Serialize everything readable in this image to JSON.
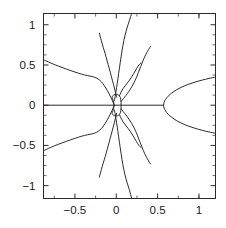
{
  "chart_data": {
    "type": "line",
    "title": "",
    "subtitle": "",
    "xlabel": "",
    "ylabel": "",
    "xlim": [
      -0.88,
      1.2
    ],
    "ylim": [
      -1.16,
      1.14
    ],
    "grid": false,
    "legend": null,
    "frame": true,
    "xticks": [
      -0.5,
      0,
      0.5,
      1
    ],
    "xtick_labels": [
      "-0.5",
      "0",
      "0.5",
      "1"
    ],
    "yticks": [
      -1,
      -0.5,
      0,
      0.5,
      1
    ],
    "ytick_labels": [
      "-1",
      "-0.5",
      "0",
      "0.5",
      "1"
    ],
    "x_minor_ticks": [
      -0.75,
      -0.25,
      0.25,
      0.75,
      1.0
    ],
    "y_minor_ticks": [
      -0.875,
      -0.75,
      -0.625,
      -0.375,
      -0.25,
      -0.125,
      0.125,
      0.25,
      0.375,
      0.625,
      0.75,
      0.875
    ],
    "series": [
      {
        "name": "real-axis-segment",
        "comment": "Horizontal line along y = 0 from left frame edge to the parabola vertex",
        "points": [
          [
            -0.88,
            0.0
          ],
          [
            0.57,
            0.0
          ]
        ]
      },
      {
        "name": "parabola-upper",
        "comment": "Upper half of rightward-opening branch from vertex near x = 0.57",
        "points": [
          [
            0.572,
            0.0
          ],
          [
            0.578,
            0.035
          ],
          [
            0.596,
            0.072
          ],
          [
            0.627,
            0.112
          ],
          [
            0.672,
            0.152
          ],
          [
            0.727,
            0.19
          ],
          [
            0.793,
            0.226
          ],
          [
            0.868,
            0.258
          ],
          [
            0.952,
            0.287
          ],
          [
            1.042,
            0.313
          ],
          [
            1.12,
            0.332
          ],
          [
            1.2,
            0.35
          ]
        ]
      },
      {
        "name": "parabola-lower",
        "comment": "Lower half of rightward-opening branch, mirror of parabola-upper",
        "points": [
          [
            0.572,
            0.0
          ],
          [
            0.578,
            -0.035
          ],
          [
            0.596,
            -0.072
          ],
          [
            0.627,
            -0.112
          ],
          [
            0.672,
            -0.152
          ],
          [
            0.727,
            -0.19
          ],
          [
            0.793,
            -0.226
          ],
          [
            0.868,
            -0.258
          ],
          [
            0.952,
            -0.287
          ],
          [
            1.042,
            -0.313
          ],
          [
            1.12,
            -0.332
          ],
          [
            1.2,
            -0.35
          ]
        ]
      },
      {
        "name": "left-branch-upper",
        "comment": "Long shallow branch exiting the left frame edge at about y = 0.57",
        "points": [
          [
            -0.88,
            0.566
          ],
          [
            -0.8,
            0.528
          ],
          [
            -0.7,
            0.486
          ],
          [
            -0.6,
            0.448
          ],
          [
            -0.5,
            0.412
          ],
          [
            -0.42,
            0.386
          ],
          [
            -0.35,
            0.368
          ],
          [
            -0.29,
            0.356
          ],
          [
            -0.24,
            0.338
          ],
          [
            -0.2,
            0.31
          ],
          [
            -0.165,
            0.272
          ],
          [
            -0.135,
            0.228
          ],
          [
            -0.108,
            0.182
          ],
          [
            -0.085,
            0.138
          ],
          [
            -0.066,
            0.098
          ],
          [
            -0.05,
            0.064
          ],
          [
            -0.038,
            0.036
          ],
          [
            -0.03,
            0.014
          ],
          [
            -0.026,
            0.0
          ]
        ]
      },
      {
        "name": "left-branch-lower",
        "comment": "Mirror of left-branch-upper below the axis",
        "points": [
          [
            -0.88,
            -0.566
          ],
          [
            -0.8,
            -0.528
          ],
          [
            -0.7,
            -0.486
          ],
          [
            -0.6,
            -0.448
          ],
          [
            -0.5,
            -0.412
          ],
          [
            -0.42,
            -0.386
          ],
          [
            -0.35,
            -0.368
          ],
          [
            -0.29,
            -0.356
          ],
          [
            -0.24,
            -0.338
          ],
          [
            -0.2,
            -0.31
          ],
          [
            -0.165,
            -0.272
          ],
          [
            -0.135,
            -0.228
          ],
          [
            -0.108,
            -0.182
          ],
          [
            -0.085,
            -0.138
          ],
          [
            -0.066,
            -0.098
          ],
          [
            -0.05,
            -0.064
          ],
          [
            -0.038,
            -0.036
          ],
          [
            -0.03,
            -0.014
          ],
          [
            -0.026,
            0.0
          ]
        ]
      },
      {
        "name": "loop-upper",
        "comment": "Upper arc of the small closed loop surrounding the origin",
        "points": [
          [
            -0.026,
            0.0
          ],
          [
            -0.03,
            0.028
          ],
          [
            -0.036,
            0.056
          ],
          [
            -0.044,
            0.082
          ],
          [
            -0.05,
            0.1
          ],
          [
            -0.044,
            0.116
          ],
          [
            -0.028,
            0.128
          ],
          [
            -0.006,
            0.134
          ],
          [
            0.018,
            0.13
          ],
          [
            0.038,
            0.116
          ],
          [
            0.05,
            0.094
          ],
          [
            0.056,
            0.066
          ],
          [
            0.058,
            0.034
          ],
          [
            0.058,
            0.0
          ]
        ]
      },
      {
        "name": "loop-lower",
        "comment": "Lower arc of the small closed loop surrounding the origin",
        "points": [
          [
            -0.026,
            0.0
          ],
          [
            -0.03,
            -0.028
          ],
          [
            -0.036,
            -0.056
          ],
          [
            -0.044,
            -0.082
          ],
          [
            -0.05,
            -0.1
          ],
          [
            -0.044,
            -0.116
          ],
          [
            -0.028,
            -0.128
          ],
          [
            -0.006,
            -0.134
          ],
          [
            0.018,
            -0.13
          ],
          [
            0.038,
            -0.116
          ],
          [
            0.05,
            -0.094
          ],
          [
            0.056,
            -0.066
          ],
          [
            0.058,
            -0.034
          ],
          [
            0.058,
            0.0
          ]
        ]
      },
      {
        "name": "steep-left-upper",
        "comment": "Steep branch rising from the knot to the top frame edge near x = 0.19",
        "points": [
          [
            -0.022,
            0.06
          ],
          [
            -0.01,
            0.13
          ],
          [
            0.004,
            0.22
          ],
          [
            0.02,
            0.33
          ],
          [
            0.038,
            0.46
          ],
          [
            0.058,
            0.6
          ],
          [
            0.08,
            0.74
          ],
          [
            0.104,
            0.86
          ],
          [
            0.13,
            0.96
          ],
          [
            0.158,
            1.05
          ],
          [
            0.186,
            1.14
          ]
        ]
      },
      {
        "name": "steep-left-lower",
        "comment": "Mirror of steep-left-upper descending to the bottom frame edge",
        "points": [
          [
            -0.022,
            -0.06
          ],
          [
            -0.01,
            -0.13
          ],
          [
            0.004,
            -0.22
          ],
          [
            0.02,
            -0.33
          ],
          [
            0.038,
            -0.46
          ],
          [
            0.058,
            -0.6
          ],
          [
            0.08,
            -0.74
          ],
          [
            0.104,
            -0.86
          ],
          [
            0.13,
            -0.96
          ],
          [
            0.158,
            -1.05
          ],
          [
            0.186,
            -1.16
          ]
        ]
      },
      {
        "name": "mid-upper-terminating",
        "comment": "Branch from knot rising left-of-centre, terminating at about (-0.20, 0.88)",
        "points": [
          [
            0.004,
            0.1
          ],
          [
            -0.012,
            0.17
          ],
          [
            -0.034,
            0.26
          ],
          [
            -0.06,
            0.36
          ],
          [
            -0.086,
            0.46
          ],
          [
            -0.11,
            0.55
          ],
          [
            -0.134,
            0.64
          ],
          [
            -0.158,
            0.72
          ],
          [
            -0.18,
            0.8
          ],
          [
            -0.196,
            0.86
          ],
          [
            -0.204,
            0.895
          ]
        ]
      },
      {
        "name": "mid-lower-terminating",
        "comment": "Mirror branch descending, terminating at about (-0.20, -0.88)",
        "points": [
          [
            0.004,
            -0.1
          ],
          [
            -0.012,
            -0.17
          ],
          [
            -0.034,
            -0.26
          ],
          [
            -0.06,
            -0.36
          ],
          [
            -0.086,
            -0.46
          ],
          [
            -0.11,
            -0.55
          ],
          [
            -0.134,
            -0.64
          ],
          [
            -0.158,
            -0.72
          ],
          [
            -0.18,
            -0.8
          ],
          [
            -0.196,
            -0.86
          ],
          [
            -0.204,
            -0.895
          ]
        ]
      },
      {
        "name": "right-upper-terminating",
        "comment": "Branch curving up and right from the knot, ending near (0.41, 0.73)",
        "points": [
          [
            0.058,
            0.046
          ],
          [
            0.086,
            0.082
          ],
          [
            0.118,
            0.122
          ],
          [
            0.152,
            0.172
          ],
          [
            0.186,
            0.226
          ],
          [
            0.216,
            0.282
          ],
          [
            0.242,
            0.34
          ],
          [
            0.268,
            0.408
          ],
          [
            0.296,
            0.482
          ],
          [
            0.326,
            0.56
          ],
          [
            0.358,
            0.632
          ],
          [
            0.392,
            0.694
          ],
          [
            0.414,
            0.73
          ]
        ]
      },
      {
        "name": "right-lower-terminating",
        "comment": "Mirror branch curving down and right, ending near (0.41, -0.73)",
        "points": [
          [
            0.058,
            -0.046
          ],
          [
            0.086,
            -0.082
          ],
          [
            0.118,
            -0.122
          ],
          [
            0.152,
            -0.172
          ],
          [
            0.186,
            -0.226
          ],
          [
            0.216,
            -0.282
          ],
          [
            0.242,
            -0.34
          ],
          [
            0.268,
            -0.408
          ],
          [
            0.296,
            -0.482
          ],
          [
            0.326,
            -0.56
          ],
          [
            0.358,
            -0.632
          ],
          [
            0.392,
            -0.694
          ],
          [
            0.414,
            -0.73
          ]
        ]
      },
      {
        "name": "inner-right-upper",
        "comment": "Short inner branch from the loop bending right then up toward (0.30, 0.52)",
        "points": [
          [
            0.04,
            0.12
          ],
          [
            0.058,
            0.162
          ],
          [
            0.082,
            0.206
          ],
          [
            0.112,
            0.248
          ],
          [
            0.146,
            0.292
          ],
          [
            0.18,
            0.342
          ],
          [
            0.212,
            0.396
          ],
          [
            0.244,
            0.452
          ],
          [
            0.274,
            0.5
          ],
          [
            0.3,
            0.527
          ]
        ]
      },
      {
        "name": "inner-right-lower",
        "comment": "Mirror inner branch toward (0.30, -0.52)",
        "points": [
          [
            0.04,
            -0.12
          ],
          [
            0.058,
            -0.162
          ],
          [
            0.082,
            -0.206
          ],
          [
            0.112,
            -0.248
          ],
          [
            0.146,
            -0.292
          ],
          [
            0.18,
            -0.342
          ],
          [
            0.212,
            -0.396
          ],
          [
            0.244,
            -0.452
          ],
          [
            0.274,
            -0.5
          ],
          [
            0.3,
            -0.527
          ]
        ]
      }
    ]
  }
}
